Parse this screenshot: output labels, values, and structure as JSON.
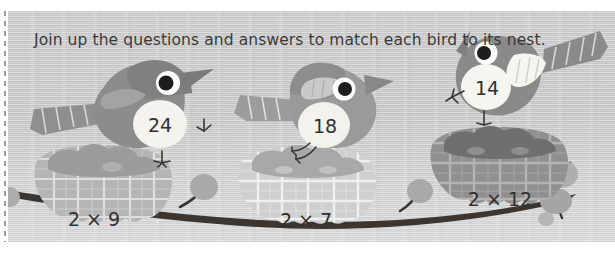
{
  "worksheet": {
    "instruction": "Join up the questions and answers to match each bird to its nest.",
    "topic": "two times table matching"
  },
  "birds": [
    {
      "id": "bird-24",
      "answer": "24",
      "facing": "left",
      "body_color": "#8c8c8c",
      "belly_color": "#f2f1ec"
    },
    {
      "id": "bird-18",
      "answer": "18",
      "facing": "right",
      "body_color": "#9a9a9a",
      "belly_color": "#f2f1ec"
    },
    {
      "id": "bird-14",
      "answer": "14",
      "facing": "left",
      "body_color": "#8a8a8a",
      "belly_color": "#f5f4ef"
    }
  ],
  "nests": [
    {
      "id": "nest-2x9",
      "equation": "2 × 9",
      "nest_color": "#b4b4b4"
    },
    {
      "id": "nest-2x7",
      "equation": "2 × 7",
      "nest_color": "#cdcdcd"
    },
    {
      "id": "nest-2x12",
      "equation": "2 × 12",
      "nest_color": "#8e8e8e"
    }
  ],
  "scene": {
    "branch_color": "#3c3632",
    "leaf_color": "#a9a9a9",
    "paper_color": "#c9c9c9",
    "ink_color": "#3a3a3a"
  }
}
